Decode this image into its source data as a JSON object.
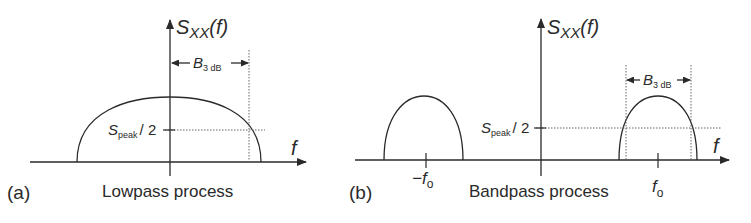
{
  "panels": [
    {
      "id": "a",
      "label": "(a)",
      "caption": "Lowpass process",
      "y_axis_label": "S",
      "y_axis_sub": "XX",
      "y_axis_arg": "(f)",
      "x_axis_label": "f",
      "half_power_label": "S",
      "half_power_sub": "peak",
      "half_power_tail": "/ 2",
      "bandwidth_label": "B",
      "bandwidth_sub": "3 dB"
    },
    {
      "id": "b",
      "label": "(b)",
      "caption": "Bandpass process",
      "y_axis_label": "S",
      "y_axis_sub": "XX",
      "y_axis_arg": "(f)",
      "x_axis_label": "f",
      "half_power_label": "S",
      "half_power_sub": "peak",
      "half_power_tail": "/ 2",
      "bandwidth_label": "B",
      "bandwidth_sub": "3 dB",
      "neg_center_label": "−f",
      "neg_center_sub": "o",
      "pos_center_label": "f",
      "pos_center_sub": "o"
    }
  ],
  "colors": {
    "line": "#2a2a2a",
    "dotted": "#666666"
  }
}
